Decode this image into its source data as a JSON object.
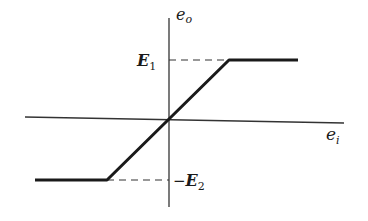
{
  "diagram": {
    "type": "transfer-characteristic",
    "axes": {
      "y_label": {
        "main": "e",
        "sub": "o"
      },
      "x_label": {
        "main": "e",
        "sub": "i"
      }
    },
    "levels": {
      "upper": {
        "main": "E",
        "sub": "1",
        "prefix": ""
      },
      "lower": {
        "main": "E",
        "sub": "2",
        "prefix": "−"
      }
    },
    "colors": {
      "line": "#1a1a1a",
      "axis": "#333333",
      "background": "#ffffff"
    },
    "curve_points": [
      [
        35,
        180
      ],
      [
        107,
        180
      ],
      [
        229,
        60
      ],
      [
        298,
        60
      ]
    ]
  }
}
